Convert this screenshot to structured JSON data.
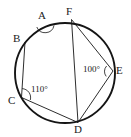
{
  "figure": {
    "type": "circle-inscribed-polygon-diagram",
    "stroke_color": "#151515",
    "background_color": "#ffffff",
    "circle": {
      "cx": 65,
      "cy": 73,
      "r": 50,
      "stroke_width": 1.9
    },
    "vertices": [
      {
        "id": "A",
        "label": "A",
        "x": 45.0,
        "y": 23.5,
        "label_x": 38,
        "label_y": 10
      },
      {
        "id": "B",
        "label": "B",
        "x": 25.0,
        "y": 42.0,
        "label_x": 13,
        "label_y": 33
      },
      {
        "id": "C",
        "label": "C",
        "x": 21.5,
        "y": 97.5,
        "label_x": 8,
        "label_y": 95
      },
      {
        "id": "D",
        "label": "D",
        "x": 78.0,
        "y": 122.5,
        "label_x": 74,
        "label_y": 125
      },
      {
        "id": "E",
        "label": "E",
        "x": 113.0,
        "y": 71.0,
        "label_x": 116,
        "label_y": 66
      },
      {
        "id": "F",
        "label": "F",
        "x": 71.5,
        "y": 19.5,
        "label_x": 66,
        "label_y": 7
      }
    ],
    "chords": [
      {
        "from": "B",
        "to": "C",
        "stroke_width": 0.9
      },
      {
        "from": "C",
        "to": "D",
        "stroke_width": 0.9
      },
      {
        "from": "D",
        "to": "E",
        "stroke_width": 0.9
      },
      {
        "from": "E",
        "to": "F",
        "stroke_width": 0.9
      },
      {
        "from": "F",
        "to": "D",
        "stroke_width": 0.9
      }
    ],
    "angle_marks": [
      {
        "at": "A",
        "label": "",
        "arc_radius": 9
      },
      {
        "at": "C",
        "label": "110°",
        "arc_radius": 9,
        "label_x": 32,
        "label_y": 86
      },
      {
        "at": "E",
        "label": "100°",
        "arc_radius": 8,
        "label_x": 84,
        "label_y": 66
      }
    ]
  },
  "labels": {
    "A": "A",
    "B": "B",
    "C": "C",
    "D": "D",
    "E": "E",
    "F": "F",
    "angle_c": "110°",
    "angle_e": "100°"
  }
}
